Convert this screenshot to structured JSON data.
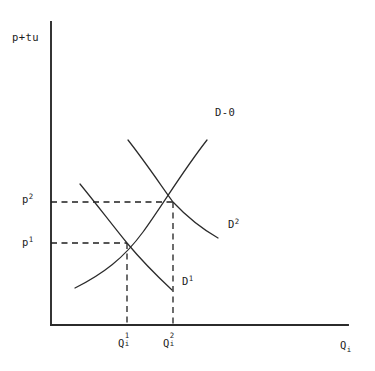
{
  "figure": {
    "kind": "economics-supply-demand-diagram",
    "background_color": "#ffffff",
    "line_color": "#2b2b2b"
  },
  "axes": {
    "y_axis_label": "p+tu",
    "x_axis_label_base": "Q",
    "x_axis_label_sub": "i",
    "origin_px": [
      51,
      325
    ],
    "y_top_px": [
      51,
      22
    ],
    "x_right_px": [
      348,
      325
    ]
  },
  "price_ticks": [
    {
      "name": "p2",
      "base": "p",
      "sup": "2",
      "y_px": 202
    },
    {
      "name": "p1",
      "base": "p",
      "sup": "1",
      "y_px": 243
    }
  ],
  "quantity_ticks": [
    {
      "name": "Q1i",
      "base": "Q",
      "sup": "1",
      "sub": "i",
      "x_px": 127
    },
    {
      "name": "Q2i",
      "base": "Q",
      "sup": "2",
      "sub": "i",
      "x_px": 173
    }
  ],
  "curve_labels": [
    {
      "name": "supply",
      "base": "D-0",
      "sup": ""
    },
    {
      "name": "demand-2",
      "base": "D",
      "sup": "2"
    },
    {
      "name": "demand-1",
      "base": "D",
      "sup": "1"
    }
  ],
  "chart_data": {
    "type": "line",
    "title": "",
    "subtitle": "",
    "xlabel": "Q_i",
    "ylabel": "p+tu",
    "xlim": [
      51,
      348
    ],
    "ylim": [
      325,
      22
    ],
    "grid": false,
    "legend": "inline-curve-labels",
    "axis_arrows": false,
    "annotations": [
      {
        "text": "D-0",
        "x": 215,
        "y": 113,
        "role": "supply-curve-label"
      },
      {
        "text": "D2",
        "x": 228,
        "y": 225,
        "role": "demand-curve-2-label"
      },
      {
        "text": "D1",
        "x": 182,
        "y": 282,
        "role": "demand-curve-1-label"
      },
      {
        "text": "p2",
        "x": 22,
        "y": 200,
        "role": "price-axis-tick-high"
      },
      {
        "text": "p1",
        "x": 22,
        "y": 243,
        "role": "price-axis-tick-low"
      },
      {
        "text": "Q1i",
        "x": 118,
        "y": 340,
        "role": "quantity-axis-tick-low"
      },
      {
        "text": "Q2i",
        "x": 163,
        "y": 340,
        "role": "quantity-axis-tick-high"
      }
    ],
    "series": [
      {
        "name": "D-0",
        "role": "supply",
        "slope": "upward",
        "curvature": "convex",
        "path": "M 75,288 C 103,274 124,258 143,232 C 162,206 182,172 207,140",
        "points": [
          [
            75,
            288
          ],
          [
            100,
            273
          ],
          [
            127,
            243
          ],
          [
            150,
            220
          ],
          [
            173,
            202
          ],
          [
            190,
            175
          ],
          [
            207,
            140
          ]
        ]
      },
      {
        "name": "D1",
        "role": "demand-initial",
        "slope": "downward",
        "curvature": "convex-to-origin",
        "path": "M 80,184 C 98,206 113,226 127,243 C 142,261 157,276 172,290",
        "points": [
          [
            80,
            184
          ],
          [
            103,
            212
          ],
          [
            127,
            243
          ],
          [
            150,
            267
          ],
          [
            172,
            290
          ]
        ]
      },
      {
        "name": "D2",
        "role": "demand-shifted",
        "slope": "downward",
        "curvature": "convex-to-origin",
        "path": "M 128,140 C 146,163 160,184 173,202 C 188,218 204,230 218,238",
        "points": [
          [
            128,
            140
          ],
          [
            150,
            172
          ],
          [
            173,
            202
          ],
          [
            196,
            224
          ],
          [
            218,
            238
          ]
        ]
      }
    ],
    "equilibria": [
      {
        "name": "E1",
        "x_px": 127,
        "y_px": 243,
        "price_label": "p1",
        "quantity_label": "Q1i",
        "curves": [
          "D-0",
          "D1"
        ]
      },
      {
        "name": "E2",
        "x_px": 173,
        "y_px": 202,
        "price_label": "p2",
        "quantity_label": "Q2i",
        "curves": [
          "D-0",
          "D2"
        ]
      }
    ],
    "guide_lines": [
      {
        "name": "p2-horizontal",
        "from": [
          51,
          202
        ],
        "to": [
          173,
          202
        ],
        "style": "dashed"
      },
      {
        "name": "p1-horizontal",
        "from": [
          51,
          243
        ],
        "to": [
          127,
          243
        ],
        "style": "dashed"
      },
      {
        "name": "Q1i-vertical",
        "from": [
          127,
          243
        ],
        "to": [
          127,
          325
        ],
        "style": "dashed"
      },
      {
        "name": "Q2i-vertical",
        "from": [
          173,
          202
        ],
        "to": [
          173,
          325
        ],
        "style": "dashed"
      }
    ]
  }
}
